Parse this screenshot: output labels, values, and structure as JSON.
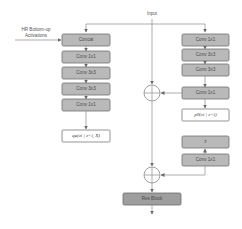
{
  "diagram": {
    "input_label": "Input",
    "side_input_label_line1": "HR Bottom-up",
    "side_input_label_line2": "Activations",
    "left_branch": {
      "blocks": [
        "Concat",
        "Conv 1x1",
        "Conv 3x3",
        "Conv 3x3",
        "Conv 1x1"
      ],
      "output_label": "qφ(zi | z<i, X)"
    },
    "right_branch": {
      "blocks": [
        "Conv 1x1",
        "Conv 3x3",
        "Conv 3x3",
        "Conv 1x1"
      ],
      "prior_label": "pθ(zi | z<i)",
      "z_label": "z",
      "post_block": "Conv 1x1"
    },
    "merge_ops": [
      "add",
      "add"
    ],
    "final_block": "Res Block"
  }
}
